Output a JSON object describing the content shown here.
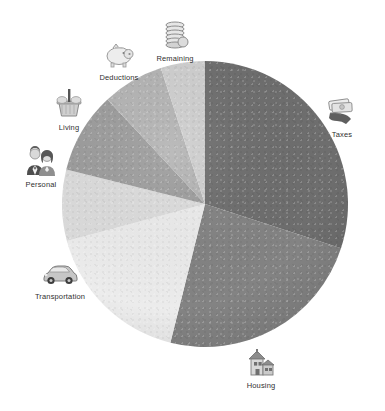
{
  "chart_data": {
    "type": "pie",
    "title": "",
    "subtitle": "",
    "xlabel": "",
    "ylabel": "",
    "legend_position": "around-slices",
    "grid": false,
    "labels": [
      "Taxes",
      "Housing",
      "Transportation",
      "Personal",
      "Living",
      "Deductions",
      "Remaining"
    ],
    "values": [
      30,
      24,
      17,
      8,
      9,
      7,
      5
    ],
    "units": "percent",
    "start_angle_deg": 0,
    "direction": "clockwise",
    "colors": [
      "#6e6e6e",
      "#838383",
      "#ececec",
      "#dcdcdc",
      "#9d9d9d",
      "#b4b4b4",
      "#cfcfcf"
    ],
    "slices": [
      {
        "label": "Taxes",
        "value": 30,
        "color": "#6e6e6e",
        "start_deg": 0,
        "end_deg": 108,
        "icon": "money-in-hand-icon"
      },
      {
        "label": "Housing",
        "value": 24,
        "color": "#838383",
        "start_deg": 108,
        "end_deg": 194,
        "icon": "house-icon"
      },
      {
        "label": "Transportation",
        "value": 17,
        "color": "#ececec",
        "start_deg": 194,
        "end_deg": 255,
        "icon": "car-icon"
      },
      {
        "label": "Personal",
        "value": 8,
        "color": "#dcdcdc",
        "start_deg": 255,
        "end_deg": 284,
        "icon": "people-icon"
      },
      {
        "label": "Living",
        "value": 9,
        "color": "#9d9d9d",
        "start_deg": 284,
        "end_deg": 317,
        "icon": "grocery-basket-icon"
      },
      {
        "label": "Deductions",
        "value": 7,
        "color": "#b4b4b4",
        "start_deg": 317,
        "end_deg": 342,
        "icon": "piggy-bank-icon"
      },
      {
        "label": "Remaining",
        "value": 5,
        "color": "#cfcfcf",
        "start_deg": 342,
        "end_deg": 360,
        "icon": "coin-stack-icon"
      }
    ]
  },
  "chart": {
    "center_x": 205,
    "center_y": 204,
    "radius": 143
  },
  "callouts": [
    {
      "label": "Remaining",
      "icon": "coin-stack-icon",
      "x": 175,
      "y": 18
    },
    {
      "label": "Deductions",
      "icon": "piggy-bank-icon",
      "x": 119,
      "y": 37
    },
    {
      "label": "Living",
      "icon": "grocery-basket-icon",
      "x": 69,
      "y": 87
    },
    {
      "label": "Personal",
      "icon": "people-icon",
      "x": 41,
      "y": 144
    },
    {
      "label": "Transportation",
      "icon": "car-icon",
      "x": 60,
      "y": 256
    },
    {
      "label": "Housing",
      "icon": "house-icon",
      "x": 261,
      "y": 345
    },
    {
      "label": "Taxes",
      "icon": "money-in-hand-icon",
      "x": 342,
      "y": 94
    }
  ]
}
